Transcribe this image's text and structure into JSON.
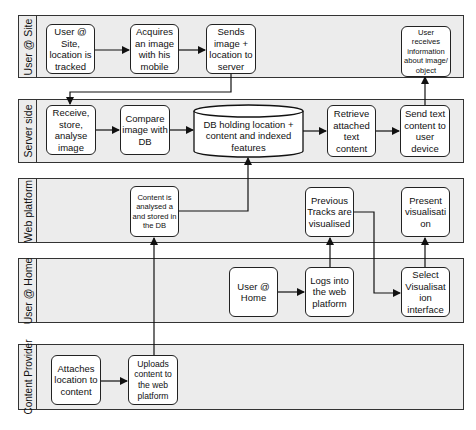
{
  "lanes": [
    {
      "id": "user-at-site",
      "label": "User @ Site"
    },
    {
      "id": "server-side",
      "label": "Server side"
    },
    {
      "id": "web-platform",
      "label": "Web platform"
    },
    {
      "id": "user-at-home",
      "label": "User @ Home"
    },
    {
      "id": "content-provider",
      "label": "Content Provider"
    }
  ],
  "nodes": {
    "user_site": "User @ Site, location is tracked",
    "acquires": "Acquires an image with his mobile",
    "sends": "Sends image + location to server",
    "user_receives": "User receives information about image/ object",
    "receive": "Receive, store, analyse image",
    "compare": "Compare image with DB",
    "db": "DB holding location + content and indexed features",
    "retrieve": "Retrieve attached text content",
    "send_text": "Send text content to user device",
    "content_analysed": "Content is analysed a and stored in the DB",
    "previous_tracks": "Previous Tracks are visualised",
    "present": "Present visualisati on",
    "user_home": "User @ Home",
    "logs_into": "Logs into the web platform",
    "select": "Select Visualisat ion interface",
    "attaches": "Attaches location to content",
    "uploads": "Uploads content to the web platform"
  },
  "edges": [
    [
      "user_site",
      "acquires"
    ],
    [
      "acquires",
      "sends"
    ],
    [
      "sends",
      "receive"
    ],
    [
      "receive",
      "compare"
    ],
    [
      "compare",
      "db"
    ],
    [
      "db",
      "retrieve"
    ],
    [
      "retrieve",
      "send_text"
    ],
    [
      "send_text",
      "user_receives"
    ],
    [
      "content_analysed",
      "db"
    ],
    [
      "user_home",
      "logs_into"
    ],
    [
      "logs_into",
      "previous_tracks"
    ],
    [
      "previous_tracks",
      "select"
    ],
    [
      "select",
      "present"
    ],
    [
      "attaches",
      "uploads"
    ],
    [
      "uploads",
      "content_analysed"
    ]
  ],
  "colors": {
    "lane_fill": "#ececec",
    "box_fill": "#ffffff",
    "stroke": "#222222"
  }
}
